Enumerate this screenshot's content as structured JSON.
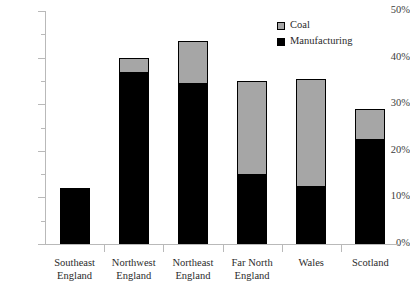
{
  "chart_data": {
    "type": "bar",
    "title": "",
    "xlabel": "",
    "ylabel": "",
    "stacked": true,
    "grid": false,
    "ylim": [
      0,
      50
    ],
    "ytick_labels": [
      "0%",
      "10%",
      "20%",
      "30%",
      "40%",
      "50%"
    ],
    "ytick_values": [
      0,
      10,
      20,
      30,
      40,
      50
    ],
    "yminor_values": [
      5,
      15,
      25,
      35,
      45
    ],
    "categories": [
      "Southeast England",
      "Northwest England",
      "Northeast England",
      "Far North England",
      "Wales",
      "Scotland"
    ],
    "category_lines": [
      [
        "Southeast",
        "England"
      ],
      [
        "Northwest",
        "England"
      ],
      [
        "Northeast",
        "England"
      ],
      [
        "Far North",
        "England"
      ],
      [
        "Wales",
        ""
      ],
      [
        "Scotland",
        ""
      ]
    ],
    "series": [
      {
        "name": "Manufacturing",
        "color": "#000000",
        "values": [
          12,
          37,
          34.5,
          15,
          12.5,
          22.5
        ]
      },
      {
        "name": "Coal",
        "color": "#a6a6a6",
        "values": [
          0,
          3,
          9,
          20,
          23,
          6.5
        ]
      }
    ],
    "totals": [
      12,
      40,
      43.5,
      35,
      35.5,
      29
    ],
    "legend": {
      "position": "top-right",
      "entries": [
        {
          "label": "Coal",
          "color": "#a6a6a6"
        },
        {
          "label": "Manufacturing",
          "color": "#000000"
        }
      ]
    },
    "axis_color": "#b9b9b9",
    "text_color": "#2b2b2b"
  }
}
